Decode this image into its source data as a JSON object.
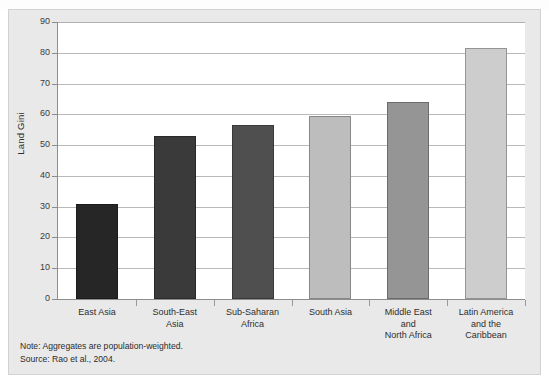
{
  "figure": {
    "clipped_header_artifact": "",
    "background_color": "#e9e9e9",
    "plot_background_color": "#ffffff"
  },
  "axis": {
    "y_title": "Land Gini",
    "y_ticks": [
      "90",
      "80",
      "70",
      "60",
      "50",
      "40",
      "30",
      "20",
      "10",
      "0"
    ]
  },
  "footnotes": {
    "note": "Note: Aggregates are population-weighted.",
    "source": "Source: Rao et al., 2004."
  },
  "chart_data": {
    "type": "bar",
    "title": "",
    "subtitle": "",
    "xlabel": "",
    "ylabel": "Land Gini",
    "ylim": [
      0,
      90
    ],
    "ytick_step": 10,
    "grid": true,
    "legend": "none",
    "categories": [
      "East Asia",
      "South-East Asia",
      "Sub-Saharan Africa",
      "South Asia",
      "Middle East and North Africa",
      "Latin America and the Caribbean"
    ],
    "category_label_lines": [
      [
        "East Asia"
      ],
      [
        "South-East",
        "Asia"
      ],
      [
        "Sub-Saharan",
        "Africa"
      ],
      [
        "South Asia"
      ],
      [
        "Middle East",
        "and",
        "North Africa"
      ],
      [
        "Latin America",
        "and the",
        "Caribbean"
      ]
    ],
    "values": [
      31,
      53,
      56.5,
      59.5,
      64,
      81.5
    ],
    "bar_colors": [
      "#262626",
      "#3a3a3a",
      "#4f4f4f",
      "#bdbdbd",
      "#959595",
      "#cdcdcd"
    ],
    "notes": [
      "Note: Aggregates are population-weighted.",
      "Source: Rao et al., 2004."
    ]
  }
}
